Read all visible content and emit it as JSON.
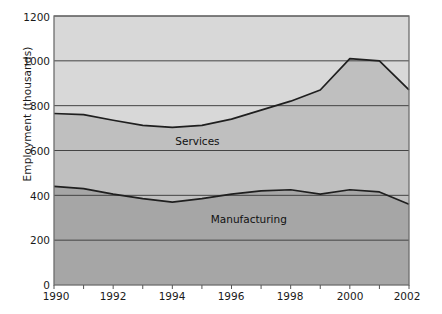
{
  "chart_data": {
    "type": "area",
    "title": "",
    "xlabel": "",
    "ylabel": "Employment  (thousands)",
    "xlim": [
      1990,
      2002
    ],
    "ylim": [
      0,
      1200
    ],
    "yticks": [
      0,
      200,
      400,
      600,
      800,
      1000,
      1200
    ],
    "xticks": [
      1990,
      1991,
      1992,
      1993,
      1994,
      1995,
      1996,
      1997,
      1998,
      1999,
      2000,
      2001,
      2002
    ],
    "xtick_labels_shown": [
      "1990",
      "1992",
      "1994",
      "1996",
      "1998",
      "2000",
      "2002"
    ],
    "grid": true,
    "legend": "inline-annotations",
    "stacked": true,
    "x": [
      1990,
      1991,
      1992,
      1993,
      1994,
      1995,
      1996,
      1997,
      1998,
      1999,
      2000,
      2001,
      2002
    ],
    "series": [
      {
        "name": "Manufacturing",
        "label_x": 1995.3,
        "label_y": 290,
        "fill_color": "#a3a3a3",
        "values": [
          440,
          430,
          405,
          385,
          370,
          385,
          405,
          420,
          425,
          405,
          425,
          415,
          360
        ]
      },
      {
        "name": "Services",
        "label_x": 1994.1,
        "label_y": 640,
        "fill_color": "#bcbcbc",
        "cumulative_top_values": [
          765,
          760,
          735,
          712,
          703,
          712,
          740,
          780,
          820,
          870,
          1010,
          1000,
          870
        ]
      }
    ],
    "background_color": "#d6d6d6",
    "line_color": "#222222",
    "gridline_color": "#444444",
    "axis_color": "#555555"
  },
  "axis": {
    "ylabel": "Employment  (thousands)",
    "ytick_labels": [
      "1200",
      "1000",
      "800",
      "600",
      "400",
      "200",
      "0"
    ],
    "xtick_labels": [
      "1990",
      "1992",
      "1994",
      "1996",
      "1998",
      "2000",
      "2002"
    ]
  },
  "annotations": {
    "services": "Services",
    "manufacturing": "Manufacturing"
  }
}
